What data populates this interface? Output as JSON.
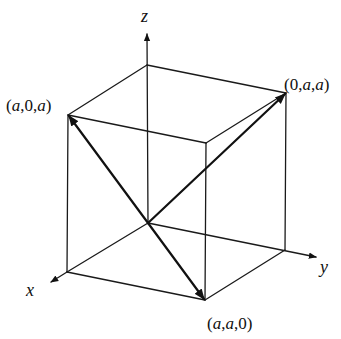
{
  "figure": {
    "axes": {
      "x": {
        "label": "x"
      },
      "y": {
        "label": "y"
      },
      "z": {
        "label": "z"
      }
    },
    "points": {
      "a0a": {
        "label_parts": [
          "(",
          "a",
          ",0,",
          "a",
          ")"
        ],
        "text": "(a,0,a)"
      },
      "0aa": {
        "label_parts": [
          "(0,",
          "a",
          ",",
          "a",
          ")"
        ],
        "text": "(0,a,a)"
      },
      "aa0": {
        "label_parts": [
          "(",
          "a",
          ",",
          "a",
          ",0)"
        ],
        "text": "(a,a,0)"
      }
    },
    "vectors": [
      {
        "from": "origin",
        "to": "(a,0,a)"
      },
      {
        "from": "origin",
        "to": "(0,a,a)"
      },
      {
        "from": "origin",
        "to": "(a,a,0)"
      }
    ],
    "colors": {
      "line": "#1a1a1a",
      "background": "#ffffff"
    }
  }
}
